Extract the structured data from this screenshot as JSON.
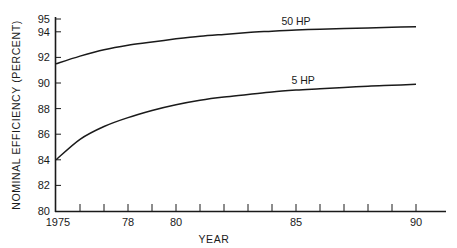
{
  "chart_data": {
    "type": "line",
    "title": "",
    "xlabel": "YEAR",
    "ylabel": "NOMINAL EFFICIENCY (PERCENT)",
    "xlim": [
      1975,
      1991.5
    ],
    "ylim": [
      80,
      95
    ],
    "grid": false,
    "legend_position": "inline labels above curves",
    "y_ticks": [
      80,
      82,
      84,
      86,
      88,
      90,
      92,
      94,
      95
    ],
    "y_tick_labels": [
      "80",
      "82",
      "84",
      "86",
      "88",
      "90",
      "92",
      "94",
      "95"
    ],
    "x_ticks": [
      1975,
      1976,
      1977,
      1978,
      1979,
      1980,
      1981,
      1982,
      1983,
      1984,
      1985,
      1986,
      1987,
      1988,
      1989,
      1990
    ],
    "x_tick_labels": [
      {
        "value": 1975,
        "label": "1975"
      },
      {
        "value": 1978,
        "label": "78"
      },
      {
        "value": 1980,
        "label": "80"
      },
      {
        "value": 1985,
        "label": "85"
      },
      {
        "value": 1990,
        "label": "90"
      }
    ],
    "x": [
      1975,
      1976,
      1977,
      1978,
      1979,
      1980,
      1981,
      1982,
      1983,
      1984,
      1985,
      1986,
      1987,
      1988,
      1989,
      1990
    ],
    "series": [
      {
        "name": "50 HP",
        "values": [
          91.5,
          92.1,
          92.6,
          92.95,
          93.2,
          93.45,
          93.65,
          93.8,
          93.95,
          94.05,
          94.15,
          94.2,
          94.25,
          94.3,
          94.35,
          94.4
        ]
      },
      {
        "name": "5 HP",
        "values": [
          84.0,
          85.6,
          86.6,
          87.3,
          87.85,
          88.3,
          88.65,
          88.9,
          89.1,
          89.3,
          89.45,
          89.55,
          89.65,
          89.75,
          89.82,
          89.9
        ]
      }
    ],
    "annotations": [
      {
        "text": "50 HP",
        "x": 1985,
        "y": 94.2
      },
      {
        "text": "5 HP",
        "x": 1985.3,
        "y": 89.6
      }
    ]
  }
}
